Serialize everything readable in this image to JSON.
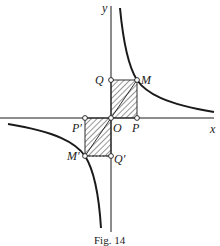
{
  "figure": {
    "caption": "Fig. 14",
    "axes": {
      "x_label": "x",
      "y_label": "y"
    },
    "points": {
      "origin": "O",
      "M": "M",
      "P": "P",
      "Q": "Q",
      "M_prime": "M′",
      "P_prime": "P′",
      "Q_prime": "Q′"
    },
    "colors": {
      "ink": "#1a1a1a",
      "background": "#ffffff"
    }
  }
}
